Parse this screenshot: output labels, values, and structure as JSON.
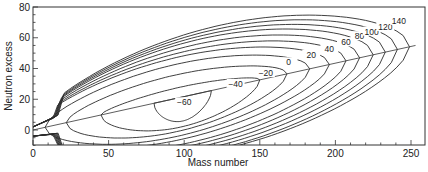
{
  "chart_data": {
    "type": "contour",
    "title": "",
    "xlabel": "Mass number",
    "ylabel": "Neutron excess",
    "xlim": [
      0,
      258
    ],
    "ylim": [
      -10,
      80
    ],
    "x_ticks": [
      0,
      50,
      100,
      150,
      200,
      250
    ],
    "y_ticks": [
      0,
      20,
      40,
      60,
      80
    ],
    "grid": false,
    "legend": null,
    "line_of_stability": {
      "from": [
        0,
        0
      ],
      "to": [
        253,
        55
      ]
    },
    "contour_levels": [
      -60,
      -40,
      -20,
      0,
      20,
      40,
      60,
      80,
      100,
      120,
      140
    ],
    "contour_labels": [
      {
        "level": "−60",
        "x": 100,
        "y": 18
      },
      {
        "level": "−40",
        "x": 134,
        "y": 30
      },
      {
        "level": "−20",
        "x": 154,
        "y": 37
      },
      {
        "level": "0",
        "x": 169,
        "y": 44
      },
      {
        "level": "20",
        "x": 184,
        "y": 49
      },
      {
        "level": "40",
        "x": 196,
        "y": 53
      },
      {
        "level": "60",
        "x": 207,
        "y": 57
      },
      {
        "level": "80",
        "x": 216,
        "y": 61
      },
      {
        "level": "100",
        "x": 224,
        "y": 64
      },
      {
        "level": "120",
        "x": 233,
        "y": 67
      },
      {
        "level": "140",
        "x": 242,
        "y": 71
      }
    ],
    "contours": [
      {
        "level": -60,
        "a_max": 118,
        "a_min": 80,
        "ridge_top": 19,
        "ridge_bot": 8
      },
      {
        "level": -40,
        "a_max": 150,
        "a_min": 45,
        "ridge_top": 30,
        "ridge_bot": 4
      },
      {
        "level": -20,
        "a_max": 168,
        "a_min": 22,
        "ridge_top": 38,
        "ridge_bot": 1
      },
      {
        "level": 0,
        "a_max": 183,
        "a_min": 8,
        "ridge_top": 45,
        "ridge_bot": -2
      },
      {
        "level": 20,
        "a_max": 196,
        "a_min": 0,
        "ridge_top": 50,
        "ridge_bot": -4
      },
      {
        "level": 40,
        "a_max": 207,
        "a_min": 0,
        "ridge_top": 54,
        "ridge_bot": -6
      },
      {
        "level": 60,
        "a_max": 216,
        "a_min": 0,
        "ridge_top": 58,
        "ridge_bot": -7
      },
      {
        "level": 80,
        "a_max": 225,
        "a_min": 0,
        "ridge_top": 62,
        "ridge_bot": -8
      },
      {
        "level": 100,
        "a_max": 233,
        "a_min": 0,
        "ridge_top": 65,
        "ridge_bot": -9
      },
      {
        "level": 120,
        "a_max": 241,
        "a_min": 0,
        "ridge_top": 68,
        "ridge_bot": -10
      },
      {
        "level": 140,
        "a_max": 249,
        "a_min": 0,
        "ridge_top": 71,
        "ridge_bot": -10
      }
    ]
  }
}
